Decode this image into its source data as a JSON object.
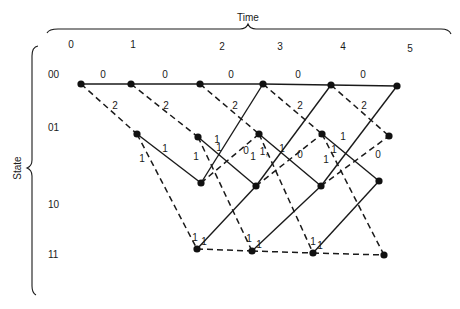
{
  "diagram": {
    "type": "trellis",
    "x_axis_title": "Time",
    "y_axis_title": "State",
    "time_labels": [
      {
        "text": "0",
        "x": 71,
        "y": 48
      },
      {
        "text": "1",
        "x": 133,
        "y": 48
      },
      {
        "text": "2",
        "x": 222,
        "y": 50
      },
      {
        "text": "3",
        "x": 280,
        "y": 50
      },
      {
        "text": "4",
        "x": 343,
        "y": 50
      },
      {
        "text": "5",
        "x": 410,
        "y": 52
      }
    ],
    "state_labels": [
      {
        "text": "00",
        "x": 48,
        "y": 78
      },
      {
        "text": "01",
        "x": 48,
        "y": 131
      },
      {
        "text": "10",
        "x": 48,
        "y": 208
      },
      {
        "text": "11",
        "x": 48,
        "y": 258
      }
    ],
    "nodes": [
      {
        "id": "00-0",
        "x": 81,
        "y": 84
      },
      {
        "id": "00-1",
        "x": 131,
        "y": 84
      },
      {
        "id": "00-2",
        "x": 200,
        "y": 84
      },
      {
        "id": "00-3",
        "x": 263,
        "y": 84
      },
      {
        "id": "00-4",
        "x": 331,
        "y": 85
      },
      {
        "id": "00-5",
        "x": 397,
        "y": 86
      },
      {
        "id": "01-1",
        "x": 137,
        "y": 134
      },
      {
        "id": "01-2",
        "x": 198,
        "y": 137
      },
      {
        "id": "01-3",
        "x": 259,
        "y": 134
      },
      {
        "id": "01-4",
        "x": 322,
        "y": 134
      },
      {
        "id": "01-5",
        "x": 389,
        "y": 136
      },
      {
        "id": "10-2",
        "x": 201,
        "y": 183
      },
      {
        "id": "10-3",
        "x": 256,
        "y": 186
      },
      {
        "id": "10-4",
        "x": 321,
        "y": 186
      },
      {
        "id": "10-5",
        "x": 379,
        "y": 181
      },
      {
        "id": "11-2",
        "x": 197,
        "y": 249
      },
      {
        "id": "11-3",
        "x": 252,
        "y": 251
      },
      {
        "id": "11-4",
        "x": 313,
        "y": 253
      },
      {
        "id": "11-5",
        "x": 384,
        "y": 255
      }
    ],
    "edges": [
      {
        "from": "00-0",
        "to": "00-1",
        "style": "solid",
        "label": "0",
        "lx": 103,
        "ly": 78
      },
      {
        "from": "00-1",
        "to": "00-2",
        "style": "solid",
        "label": "0",
        "lx": 165,
        "ly": 78
      },
      {
        "from": "00-2",
        "to": "00-3",
        "style": "solid",
        "label": "0",
        "lx": 231,
        "ly": 78
      },
      {
        "from": "00-3",
        "to": "00-4",
        "style": "solid",
        "label": "0",
        "lx": 298,
        "ly": 78
      },
      {
        "from": "00-4",
        "to": "00-5",
        "style": "solid",
        "label": "0",
        "lx": 363,
        "ly": 78
      },
      {
        "from": "00-0",
        "to": "01-1",
        "style": "dashed",
        "label": "2",
        "lx": 115,
        "ly": 109
      },
      {
        "from": "00-1",
        "to": "01-2",
        "style": "dashed",
        "label": "2",
        "lx": 166,
        "ly": 109
      },
      {
        "from": "00-2",
        "to": "01-3",
        "style": "dashed",
        "label": "2",
        "lx": 235,
        "ly": 109
      },
      {
        "from": "00-3",
        "to": "01-4",
        "style": "dashed",
        "label": "2",
        "lx": 300,
        "ly": 109
      },
      {
        "from": "00-4",
        "to": "01-5",
        "style": "dashed",
        "label": "2",
        "lx": 364,
        "ly": 109
      },
      {
        "from": "01-1",
        "to": "10-2",
        "style": "solid",
        "label": "1",
        "lx": 165,
        "ly": 152
      },
      {
        "from": "01-2",
        "to": "10-3",
        "style": "solid",
        "label": "1",
        "lx": 219,
        "ly": 151
      },
      {
        "from": "01-3",
        "to": "10-4",
        "style": "solid",
        "label": "1,",
        "lx": 264,
        "ly": 155
      },
      {
        "from": "01-4",
        "to": "10-5",
        "style": "solid",
        "label": "1",
        "lx": 334,
        "ly": 153
      },
      {
        "from": "01-1",
        "to": "11-2",
        "style": "dashed",
        "label": "1",
        "lx": 142,
        "ly": 162
      },
      {
        "from": "01-2",
        "to": "11-3",
        "style": "dashed",
        "label": "1",
        "lx": 196,
        "ly": 160
      },
      {
        "from": "01-3",
        "to": "11-4",
        "style": "dashed",
        "label": "1",
        "lx": 253,
        "ly": 160
      },
      {
        "from": "01-4",
        "to": "11-5",
        "style": "dashed",
        "label": "1",
        "lx": 326,
        "ly": 163
      },
      {
        "from": "10-2",
        "to": "00-3",
        "style": "solid",
        "label": "1",
        "lx": 217,
        "ly": 143
      },
      {
        "from": "10-3",
        "to": "00-4",
        "style": "solid",
        "label": "1",
        "lx": 282,
        "ly": 152
      },
      {
        "from": "10-4",
        "to": "00-5",
        "style": "solid",
        "label": "1",
        "lx": 343,
        "ly": 140
      },
      {
        "from": "10-2",
        "to": "01-3",
        "style": "dashed",
        "label": "0",
        "lx": 246,
        "ly": 154
      },
      {
        "from": "10-3",
        "to": "01-4",
        "style": "dashed",
        "label": "0",
        "lx": 300,
        "ly": 158
      },
      {
        "from": "10-4",
        "to": "01-5",
        "style": "dashed",
        "label": "0",
        "lx": 378,
        "ly": 158
      },
      {
        "from": "11-2",
        "to": "10-3",
        "style": "solid",
        "label": "1",
        "lx": 204,
        "ly": 245
      },
      {
        "from": "11-3",
        "to": "10-4",
        "style": "solid",
        "label": "1",
        "lx": 259,
        "ly": 248
      },
      {
        "from": "11-4",
        "to": "10-5",
        "style": "solid",
        "label": "1",
        "lx": 320,
        "ly": 249
      },
      {
        "from": "11-2",
        "to": "11-3",
        "style": "dashed",
        "label": "1",
        "lx": 195,
        "ly": 241
      },
      {
        "from": "11-3",
        "to": "11-4",
        "style": "dashed",
        "label": "1",
        "lx": 249,
        "ly": 242
      },
      {
        "from": "11-4",
        "to": "11-5",
        "style": "dashed",
        "label": "1",
        "lx": 313,
        "ly": 245
      }
    ]
  }
}
